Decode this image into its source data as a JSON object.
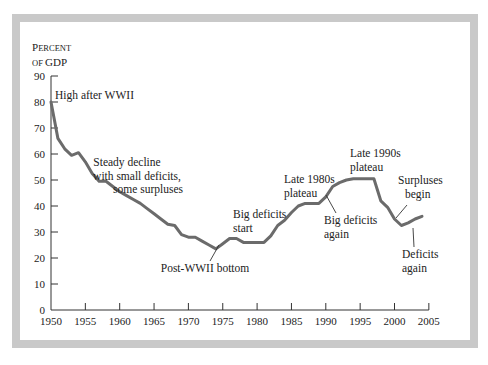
{
  "chart_data": {
    "type": "line",
    "title": "",
    "ylabel_line1": "Percent",
    "ylabel_line2": "of GDP",
    "xlabel": "",
    "ylim": [
      0,
      90
    ],
    "xlim": [
      1950,
      2005
    ],
    "grid": false,
    "yticks": [
      "0",
      "10",
      "20",
      "30",
      "40",
      "50",
      "60",
      "70",
      "80",
      "90"
    ],
    "xticks": [
      "1950",
      "1955",
      "1960",
      "1965",
      "1970",
      "1975",
      "1980",
      "1985",
      "1990",
      "1995",
      "2000",
      "2005"
    ],
    "series": [
      {
        "name": "Federal debt held by public (% of GDP)",
        "color": "#6b6b6b",
        "x": [
          1950,
          1951,
          1952,
          1953,
          1954,
          1955,
          1956,
          1957,
          1958,
          1959,
          1960,
          1961,
          1962,
          1963,
          1964,
          1965,
          1966,
          1967,
          1968,
          1969,
          1970,
          1971,
          1972,
          1973,
          1974,
          1975,
          1976,
          1977,
          1978,
          1979,
          1980,
          1981,
          1982,
          1983,
          1984,
          1985,
          1986,
          1987,
          1988,
          1989,
          1990,
          1991,
          1992,
          1993,
          1994,
          1995,
          1996,
          1997,
          1998,
          1999,
          2000,
          2001,
          2002,
          2003,
          2004
        ],
        "values": [
          80,
          66,
          62,
          59.5,
          60.5,
          57,
          52.5,
          49.5,
          49.5,
          47.5,
          45.5,
          44,
          42.5,
          41,
          39,
          37,
          35,
          33,
          32.5,
          29,
          28,
          28,
          26.5,
          25,
          23.5,
          25.5,
          27.5,
          27.5,
          26,
          26,
          26,
          26,
          28.5,
          32.5,
          34.5,
          37.5,
          40,
          41,
          41,
          41,
          43.5,
          47.5,
          49,
          50,
          50.5,
          50.5,
          50.5,
          50.5,
          42,
          39.5,
          35,
          32.5,
          33.5,
          35,
          36
        ]
      }
    ],
    "annotations": [
      {
        "text": "High after WWII",
        "year": 1950,
        "value": 80
      },
      {
        "text": "Steady decline",
        "text2": "with small deficits,",
        "text3": "some surpluses"
      },
      {
        "text": "Post-WWII bottom",
        "year": 1974,
        "value": 23.5
      },
      {
        "text": "Big deficits",
        "text2": "start",
        "year": 1982
      },
      {
        "text": "Late 1980s",
        "text2": "plateau",
        "year": 1988
      },
      {
        "text": "Big deficits",
        "text2": "again",
        "year": 1991
      },
      {
        "text": "Late 1990s",
        "text2": "plateau",
        "year": 1996
      },
      {
        "text": "Surpluses",
        "text2": "begin",
        "year": 1999
      },
      {
        "text": "Deficits",
        "text2": "again",
        "year": 2002
      }
    ]
  }
}
